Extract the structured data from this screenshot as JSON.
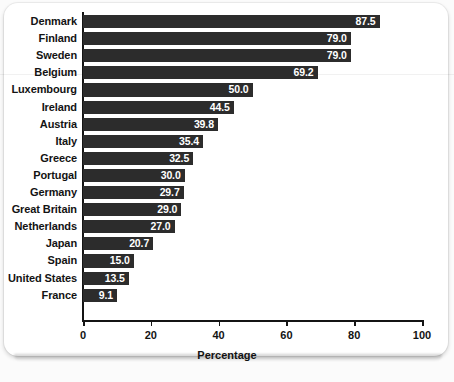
{
  "chart_data": {
    "type": "bar",
    "orientation": "horizontal",
    "title": "",
    "xlabel": "Percentage",
    "ylabel": "",
    "xlim": [
      0,
      100
    ],
    "xticks": [
      0,
      20,
      40,
      60,
      80,
      100
    ],
    "grid": false,
    "legend": null,
    "bar_color": "#2c2c2c",
    "value_label_color": "#ffffff",
    "categories": [
      "Denmark",
      "Finland",
      "Sweden",
      "Belgium",
      "Luxembourg",
      "Ireland",
      "Austria",
      "Italy",
      "Greece",
      "Portugal",
      "Germany",
      "Great Britain",
      "Netherlands",
      "Japan",
      "Spain",
      "United States",
      "France"
    ],
    "values": [
      87.5,
      79.0,
      79.0,
      69.2,
      50.0,
      44.5,
      39.8,
      35.4,
      32.5,
      30.0,
      29.7,
      29.0,
      27.0,
      20.7,
      15.0,
      13.5,
      9.1
    ],
    "value_labels": [
      "87.5",
      "79.0",
      "79.0",
      "69.2",
      "50.0",
      "44.5",
      "39.8",
      "35.4",
      "32.5",
      "30.0",
      "29.7",
      "29.0",
      "27.0",
      "20.7",
      "15.0",
      "13.5",
      "9.1"
    ],
    "xtick_labels": [
      "0",
      "20",
      "40",
      "60",
      "80",
      "100"
    ]
  }
}
